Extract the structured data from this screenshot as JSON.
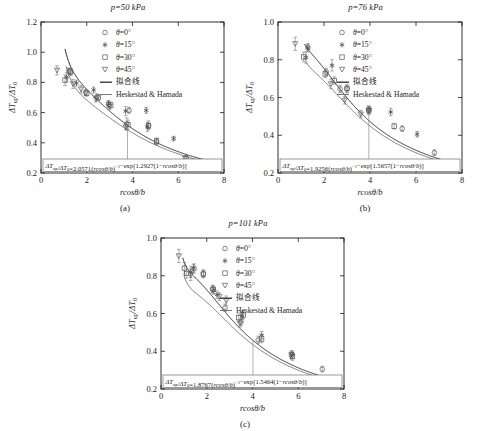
{
  "figure": {
    "xlabel": "rcosθ/b",
    "ylabel_num": "ΔT",
    "ylabel_sub1": "up",
    "ylabel_den": "/ΔT",
    "ylabel_sub0": "0",
    "legend": [
      {
        "marker": "circle-open",
        "label": "θ=0°"
      },
      {
        "marker": "asterisk",
        "label": "θ=15°"
      },
      {
        "marker": "square-open",
        "label": "θ=30°"
      },
      {
        "marker": "triangle-down-open",
        "label": "θ=45°"
      },
      {
        "marker": "line-thick",
        "label": "拟合线"
      },
      {
        "marker": "line-thin",
        "label": "Heskestad & Hamada"
      }
    ]
  },
  "chart_data": [
    {
      "type": "scatter",
      "panel": "a",
      "panel_label": "(a)",
      "title": "p=50 kPa",
      "pressure_kPa": 50,
      "xlabel": "rcosθ/b",
      "ylabel": "ΔTup/ΔT0",
      "xlim": [
        0,
        8
      ],
      "ylim": [
        0.2,
        1.2
      ],
      "xticks": [
        0,
        2,
        4,
        6,
        8
      ],
      "yticks": [
        0.2,
        0.4,
        0.6,
        0.8,
        1.0,
        1.2
      ],
      "grid": false,
      "legend_position": "top-right",
      "equation": "ΔT_up/ΔT_0=2.0571(rcosθ/b)^−1−exp[1.2927(1−rcosθ/b)]",
      "equation_coeff_a": 2.0571,
      "equation_coeff_b": 1.2927,
      "series": [
        {
          "name": "θ=0°",
          "marker": "circle-open",
          "points": [
            [
              1.22,
              0.875
            ],
            [
              1.3,
              0.865
            ],
            [
              1.95,
              0.735
            ],
            [
              2.45,
              0.705
            ],
            [
              2.95,
              0.655
            ],
            [
              3.75,
              0.525
            ],
            [
              3.85,
              0.615
            ],
            [
              4.7,
              0.515
            ],
            [
              5.05,
              0.405
            ],
            [
              6.35,
              0.3
            ]
          ],
          "err": [
            0.02,
            0.02,
            0.02,
            0.02,
            0.02,
            0.04,
            0.02,
            0.03,
            0.02,
            0.015
          ]
        },
        {
          "name": "θ=15°",
          "marker": "asterisk",
          "points": [
            [
              1.12,
              0.835
            ],
            [
              1.55,
              0.795
            ],
            [
              2.3,
              0.75
            ],
            [
              2.95,
              0.66
            ],
            [
              3.7,
              0.61
            ],
            [
              4.6,
              0.615
            ],
            [
              4.65,
              0.505
            ],
            [
              5.8,
              0.428
            ]
          ],
          "err": [
            0.03,
            0.02,
            0.02,
            0.02,
            0.03,
            0.02,
            0.03,
            0.015
          ]
        },
        {
          "name": "θ=30°",
          "marker": "square-open",
          "points": [
            [
              1.05,
              0.815
            ],
            [
              1.28,
              0.875
            ],
            [
              2.0,
              0.728
            ],
            [
              2.5,
              0.7
            ],
            [
              3.05,
              0.65
            ],
            [
              3.8,
              0.52
            ],
            [
              4.7,
              0.512
            ],
            [
              5.05,
              0.412
            ]
          ],
          "err": [
            0.035,
            0.02,
            0.02,
            0.02,
            0.02,
            0.03,
            0.02,
            0.02
          ]
        },
        {
          "name": "θ=45°",
          "marker": "triangle-down-open",
          "points": [
            [
              0.7,
              0.88
            ],
            [
              1.4,
              0.79
            ],
            [
              1.75,
              0.755
            ],
            [
              2.4,
              0.69
            ],
            [
              3.0,
              0.64
            ],
            [
              3.7,
              0.505
            ],
            [
              6.3,
              0.298
            ]
          ],
          "err": [
            0.03,
            0.03,
            0.025,
            0.02,
            0.02,
            0.02,
            0.015
          ]
        }
      ]
    },
    {
      "type": "scatter",
      "panel": "b",
      "panel_label": "(b)",
      "title": "p=76 kPa",
      "pressure_kPa": 76,
      "xlabel": "rcosθ/b",
      "ylabel": "ΔTup/ΔT0",
      "xlim": [
        0,
        8
      ],
      "ylim": [
        0.2,
        1.0
      ],
      "xticks": [
        0,
        2,
        4,
        6,
        8
      ],
      "yticks": [
        0.2,
        0.4,
        0.6,
        0.8,
        1.0
      ],
      "grid": false,
      "legend_position": "top-right",
      "equation": "ΔT_up/ΔT_0=1.9256(rcosθ/b)^−1−exp[1.5657(1−rcosθ/b)]",
      "equation_coeff_a": 1.9256,
      "equation_coeff_b": 1.5657,
      "series": [
        {
          "name": "θ=0°",
          "marker": "circle-open",
          "points": [
            [
              1.3,
              0.865
            ],
            [
              2.1,
              0.735
            ],
            [
              2.7,
              0.645
            ],
            [
              3.0,
              0.645
            ],
            [
              3.95,
              0.533
            ],
            [
              5.4,
              0.435
            ],
            [
              6.8,
              0.308
            ]
          ],
          "err": [
            0.02,
            0.02,
            0.02,
            0.02,
            0.02,
            0.015,
            0.015
          ]
        },
        {
          "name": "θ=15°",
          "marker": "asterisk",
          "points": [
            [
              1.22,
              0.812
            ],
            [
              1.3,
              0.862
            ],
            [
              2.35,
              0.77
            ],
            [
              3.95,
              0.535
            ],
            [
              4.9,
              0.523
            ],
            [
              6.05,
              0.405
            ]
          ],
          "err": [
            0.03,
            0.02,
            0.03,
            0.02,
            0.02,
            0.015
          ]
        },
        {
          "name": "θ=30°",
          "marker": "square-open",
          "points": [
            [
              1.12,
              0.815
            ],
            [
              2.05,
              0.725
            ],
            [
              2.45,
              0.69
            ],
            [
              3.0,
              0.648
            ],
            [
              3.95,
              0.533
            ],
            [
              5.05,
              0.448
            ]
          ],
          "err": [
            0.025,
            0.02,
            0.02,
            0.02,
            0.02,
            0.015
          ]
        },
        {
          "name": "θ=45°",
          "marker": "triangle-down-open",
          "points": [
            [
              0.75,
              0.885
            ],
            [
              2.3,
              0.672
            ],
            [
              2.9,
              0.585
            ],
            [
              3.6,
              0.512
            ],
            [
              3.95,
              0.532
            ]
          ],
          "err": [
            0.035,
            0.025,
            0.02,
            0.02,
            0.02
          ]
        }
      ]
    },
    {
      "type": "scatter",
      "panel": "c",
      "panel_label": "(c)",
      "title": "p=101 kPa",
      "pressure_kPa": 101,
      "xlabel": "rcosθ/b",
      "ylabel": "ΔTup/ΔT0",
      "xlim": [
        0,
        8
      ],
      "ylim": [
        0.2,
        1.0
      ],
      "xticks": [
        0,
        2,
        4,
        6,
        8
      ],
      "yticks": [
        0.2,
        0.4,
        0.6,
        0.8,
        1.0
      ],
      "grid": false,
      "legend_position": "top-right",
      "equation": "ΔT_up/ΔT_0=1.8767(rcosθ/b)^−1−exp[1.5464(1−rcosθ/b)]",
      "equation_coeff_a": 1.8767,
      "equation_coeff_b": 1.5464,
      "series": [
        {
          "name": "θ=0°",
          "marker": "circle-open",
          "points": [
            [
              1.45,
              0.838
            ],
            [
              1.85,
              0.812
            ],
            [
              2.25,
              0.73
            ],
            [
              2.8,
              0.63
            ],
            [
              3.5,
              0.555
            ],
            [
              4.25,
              0.46
            ],
            [
              5.7,
              0.378
            ],
            [
              7.05,
              0.305
            ]
          ],
          "err": [
            0.025,
            0.02,
            0.02,
            0.02,
            0.02,
            0.02,
            0.02,
            0.015
          ]
        },
        {
          "name": "θ=15°",
          "marker": "asterisk",
          "points": [
            [
              1.3,
              0.82
            ],
            [
              1.42,
              0.84
            ],
            [
              2.3,
              0.722
            ],
            [
              2.45,
              0.7
            ],
            [
              3.55,
              0.588
            ],
            [
              4.4,
              0.485
            ],
            [
              5.75,
              0.382
            ]
          ],
          "err": [
            0.03,
            0.02,
            0.02,
            0.02,
            0.02,
            0.02,
            0.02
          ]
        },
        {
          "name": "θ=30°",
          "marker": "square-open",
          "points": [
            [
              1.02,
              0.84
            ],
            [
              1.12,
              0.812
            ],
            [
              1.85,
              0.808
            ],
            [
              2.28,
              0.728
            ],
            [
              3.4,
              0.578
            ],
            [
              3.6,
              0.592
            ],
            [
              4.4,
              0.465
            ],
            [
              5.75,
              0.372
            ]
          ],
          "err": [
            0.03,
            0.025,
            0.02,
            0.02,
            0.02,
            0.02,
            0.02,
            0.02
          ]
        },
        {
          "name": "θ=45°",
          "marker": "triangle-down-open",
          "points": [
            [
              0.78,
              0.905
            ],
            [
              1.3,
              0.805
            ],
            [
              2.55,
              0.69
            ],
            [
              2.85,
              0.668
            ],
            [
              3.45,
              0.548
            ],
            [
              5.7,
              0.382
            ]
          ],
          "err": [
            0.035,
            0.03,
            0.02,
            0.025,
            0.02,
            0.02
          ]
        }
      ]
    }
  ]
}
